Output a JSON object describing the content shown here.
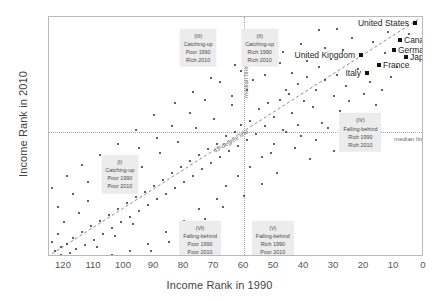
{
  "chart_data": {
    "type": "scatter",
    "title": "",
    "xlabel": "Income Rank in 1990",
    "ylabel": "Income Rank in 2010",
    "xlim": [
      125,
      0
    ],
    "ylim": [
      125,
      0
    ],
    "x_reversed": true,
    "y_reversed": true,
    "grid": false,
    "legend": "none",
    "xticks": [
      120,
      110,
      100,
      90,
      80,
      70,
      60,
      50,
      40,
      30,
      20,
      10,
      0
    ],
    "yticks": [
      0,
      10,
      20,
      30,
      40,
      50,
      60,
      70,
      80,
      90,
      100,
      110,
      120
    ],
    "reference_lines": [
      {
        "name": "median-line-vertical",
        "label": "median line",
        "orientation": "vertical",
        "value": 60,
        "style": "dotted"
      },
      {
        "name": "median-line-horizontal",
        "label": "median line",
        "orientation": "horizontal",
        "value": 60,
        "style": "dotted"
      },
      {
        "name": "forty-five-degree-line",
        "label": "45-degree line",
        "orientation": "diagonal",
        "style": "dashed"
      }
    ],
    "highlighted_points": [
      {
        "name": "United States",
        "x": 3,
        "y": 3
      },
      {
        "name": "Canada",
        "x": 8,
        "y": 12
      },
      {
        "name": "Germany",
        "x": 10,
        "y": 17
      },
      {
        "name": "Japan",
        "x": 6,
        "y": 21
      },
      {
        "name": "United Kingdom",
        "x": 21,
        "y": 20
      },
      {
        "name": "France",
        "x": 15,
        "y": 25
      },
      {
        "name": "Italy",
        "x": 19,
        "y": 29
      }
    ],
    "points": [
      {
        "x": 3,
        "y": 3
      },
      {
        "x": 8,
        "y": 12
      },
      {
        "x": 10,
        "y": 17
      },
      {
        "x": 6,
        "y": 21
      },
      {
        "x": 21,
        "y": 20
      },
      {
        "x": 15,
        "y": 25
      },
      {
        "x": 19,
        "y": 29
      },
      {
        "x": 5,
        "y": 9
      },
      {
        "x": 12,
        "y": 8
      },
      {
        "x": 17,
        "y": 13
      },
      {
        "x": 24,
        "y": 11
      },
      {
        "x": 13,
        "y": 19
      },
      {
        "x": 27,
        "y": 17
      },
      {
        "x": 31,
        "y": 22
      },
      {
        "x": 22,
        "y": 27
      },
      {
        "x": 29,
        "y": 30
      },
      {
        "x": 35,
        "y": 26
      },
      {
        "x": 18,
        "y": 34
      },
      {
        "x": 26,
        "y": 36
      },
      {
        "x": 33,
        "y": 33
      },
      {
        "x": 39,
        "y": 31
      },
      {
        "x": 36,
        "y": 38
      },
      {
        "x": 42,
        "y": 35
      },
      {
        "x": 30,
        "y": 41
      },
      {
        "x": 45,
        "y": 40
      },
      {
        "x": 40,
        "y": 44
      },
      {
        "x": 48,
        "y": 43
      },
      {
        "x": 37,
        "y": 47
      },
      {
        "x": 52,
        "y": 45
      },
      {
        "x": 44,
        "y": 50
      },
      {
        "x": 55,
        "y": 48
      },
      {
        "x": 50,
        "y": 52
      },
      {
        "x": 58,
        "y": 54
      },
      {
        "x": 53,
        "y": 57
      },
      {
        "x": 61,
        "y": 56
      },
      {
        "x": 47,
        "y": 59
      },
      {
        "x": 56,
        "y": 61
      },
      {
        "x": 63,
        "y": 60
      },
      {
        "x": 59,
        "y": 64
      },
      {
        "x": 66,
        "y": 62
      },
      {
        "x": 62,
        "y": 67
      },
      {
        "x": 69,
        "y": 66
      },
      {
        "x": 65,
        "y": 70
      },
      {
        "x": 72,
        "y": 69
      },
      {
        "x": 68,
        "y": 73
      },
      {
        "x": 75,
        "y": 72
      },
      {
        "x": 71,
        "y": 76
      },
      {
        "x": 78,
        "y": 75
      },
      {
        "x": 74,
        "y": 79
      },
      {
        "x": 81,
        "y": 78
      },
      {
        "x": 77,
        "y": 83
      },
      {
        "x": 84,
        "y": 81
      },
      {
        "x": 80,
        "y": 86
      },
      {
        "x": 87,
        "y": 85
      },
      {
        "x": 83,
        "y": 89
      },
      {
        "x": 90,
        "y": 88
      },
      {
        "x": 86,
        "y": 92
      },
      {
        "x": 93,
        "y": 91
      },
      {
        "x": 89,
        "y": 95
      },
      {
        "x": 96,
        "y": 94
      },
      {
        "x": 92,
        "y": 98
      },
      {
        "x": 99,
        "y": 97
      },
      {
        "x": 95,
        "y": 101
      },
      {
        "x": 102,
        "y": 100
      },
      {
        "x": 98,
        "y": 104
      },
      {
        "x": 105,
        "y": 103
      },
      {
        "x": 101,
        "y": 107
      },
      {
        "x": 108,
        "y": 106
      },
      {
        "x": 104,
        "y": 110
      },
      {
        "x": 111,
        "y": 109
      },
      {
        "x": 107,
        "y": 113
      },
      {
        "x": 114,
        "y": 112
      },
      {
        "x": 110,
        "y": 116
      },
      {
        "x": 117,
        "y": 115
      },
      {
        "x": 113,
        "y": 119
      },
      {
        "x": 119,
        "y": 118
      },
      {
        "x": 116,
        "y": 121
      },
      {
        "x": 121,
        "y": 120
      },
      {
        "x": 118,
        "y": 123
      },
      {
        "x": 34,
        "y": 55
      },
      {
        "x": 41,
        "y": 62
      },
      {
        "x": 28,
        "y": 49
      },
      {
        "x": 46,
        "y": 38
      },
      {
        "x": 57,
        "y": 33
      },
      {
        "x": 43,
        "y": 68
      },
      {
        "x": 51,
        "y": 71
      },
      {
        "x": 64,
        "y": 46
      },
      {
        "x": 70,
        "y": 53
      },
      {
        "x": 38,
        "y": 74
      },
      {
        "x": 49,
        "y": 81
      },
      {
        "x": 76,
        "y": 58
      },
      {
        "x": 82,
        "y": 65
      },
      {
        "x": 54,
        "y": 87
      },
      {
        "x": 60,
        "y": 93
      },
      {
        "x": 88,
        "y": 71
      },
      {
        "x": 94,
        "y": 78
      },
      {
        "x": 67,
        "y": 99
      },
      {
        "x": 73,
        "y": 105
      },
      {
        "x": 100,
        "y": 84
      },
      {
        "x": 106,
        "y": 90
      },
      {
        "x": 79,
        "y": 111
      },
      {
        "x": 85,
        "y": 117
      },
      {
        "x": 112,
        "y": 96
      },
      {
        "x": 91,
        "y": 122
      },
      {
        "x": 115,
        "y": 102
      },
      {
        "x": 97,
        "y": 108
      },
      {
        "x": 103,
        "y": 114
      },
      {
        "x": 109,
        "y": 120
      },
      {
        "x": 120,
        "y": 107
      },
      {
        "x": 122,
        "y": 113
      },
      {
        "x": 123,
        "y": 122
      },
      {
        "x": 25,
        "y": 44
      },
      {
        "x": 32,
        "y": 58
      },
      {
        "x": 20,
        "y": 40
      },
      {
        "x": 16,
        "y": 46
      },
      {
        "x": 23,
        "y": 53
      },
      {
        "x": 11,
        "y": 31
      },
      {
        "x": 14,
        "y": 38
      },
      {
        "x": 9,
        "y": 26
      },
      {
        "x": 58,
        "y": 78
      },
      {
        "x": 62,
        "y": 83
      },
      {
        "x": 66,
        "y": 88
      },
      {
        "x": 54,
        "y": 73
      },
      {
        "x": 50,
        "y": 66
      },
      {
        "x": 46,
        "y": 60
      },
      {
        "x": 42,
        "y": 56
      },
      {
        "x": 69,
        "y": 95
      },
      {
        "x": 75,
        "y": 100
      },
      {
        "x": 80,
        "y": 106
      },
      {
        "x": 86,
        "y": 112
      },
      {
        "x": 92,
        "y": 118
      },
      {
        "x": 98,
        "y": 122
      },
      {
        "x": 104,
        "y": 124
      },
      {
        "x": 36,
        "y": 64
      },
      {
        "x": 30,
        "y": 70
      },
      {
        "x": 26,
        "y": 63
      },
      {
        "x": 44,
        "y": 29
      },
      {
        "x": 39,
        "y": 23
      },
      {
        "x": 33,
        "y": 16
      },
      {
        "x": 48,
        "y": 24
      },
      {
        "x": 53,
        "y": 30
      },
      {
        "x": 59,
        "y": 38
      },
      {
        "x": 64,
        "y": 41
      },
      {
        "x": 55,
        "y": 20
      },
      {
        "x": 61,
        "y": 28
      },
      {
        "x": 68,
        "y": 34
      },
      {
        "x": 73,
        "y": 43
      },
      {
        "x": 78,
        "y": 50
      },
      {
        "x": 84,
        "y": 57
      },
      {
        "x": 89,
        "y": 63
      },
      {
        "x": 95,
        "y": 68
      },
      {
        "x": 101,
        "y": 74
      },
      {
        "x": 107,
        "y": 80
      },
      {
        "x": 112,
        "y": 86
      },
      {
        "x": 117,
        "y": 92
      },
      {
        "x": 122,
        "y": 99
      },
      {
        "x": 35,
        "y": 7
      },
      {
        "x": 41,
        "y": 14
      },
      {
        "x": 47,
        "y": 18
      },
      {
        "x": 52,
        "y": 10
      },
      {
        "x": 29,
        "y": 6
      },
      {
        "x": 57,
        "y": 15
      },
      {
        "x": 63,
        "y": 25
      },
      {
        "x": 71,
        "y": 32
      },
      {
        "x": 77,
        "y": 39
      },
      {
        "x": 83,
        "y": 45
      },
      {
        "x": 90,
        "y": 51
      },
      {
        "x": 96,
        "y": 59
      },
      {
        "x": 102,
        "y": 66
      },
      {
        "x": 108,
        "y": 72
      },
      {
        "x": 114,
        "y": 77
      },
      {
        "x": 119,
        "y": 83
      },
      {
        "x": 124,
        "y": 89
      },
      {
        "x": 124,
        "y": 117
      },
      {
        "x": 121,
        "y": 124
      }
    ]
  },
  "regions": [
    {
      "id": "region-i",
      "roman": "(I)",
      "trend": "Catching-up",
      "line1": "Poor 1990",
      "line2": "Poor 2010",
      "left_pct": 19.0,
      "top_pct": 66.0
    },
    {
      "id": "region-ii",
      "roman": "(II)",
      "trend": "Catching-up",
      "line1": "Rich 1990",
      "line2": "Rich 2010",
      "left_pct": 56.5,
      "top_pct": 13.0
    },
    {
      "id": "region-iii",
      "roman": "(III)",
      "trend": "Catching-up",
      "line1": "Poor 1990",
      "line2": "Rich 2010",
      "left_pct": 40.0,
      "top_pct": 13.0
    },
    {
      "id": "region-iv",
      "roman": "(IV)",
      "trend": "Falling-behind",
      "line1": "Rich 1990",
      "line2": "Rich 2010",
      "left_pct": 83.5,
      "top_pct": 48.5
    },
    {
      "id": "region-v",
      "roman": "(V)",
      "trend": "Falling-behind",
      "line1": "Rich 1990",
      "line2": "Poor 2010",
      "left_pct": 60.0,
      "top_pct": 93.5
    },
    {
      "id": "region-vi",
      "roman": "(VI)",
      "trend": "Falling-behind",
      "line1": "Poor 1990",
      "line2": "Poor 2010",
      "left_pct": 40.5,
      "top_pct": 93.5
    }
  ],
  "line_labels": {
    "median_vertical": "median line",
    "median_horizontal": "median line",
    "diagonal": "45-degree line"
  },
  "colors": {
    "point": "#2e2e2e",
    "highlight_point": "#111111",
    "frame": "#b9b9b9",
    "median_line": "#a5a5a5",
    "diagonal_line": "#8a8a8a",
    "region_box": "#ececec",
    "text": "#3c3c3c"
  }
}
